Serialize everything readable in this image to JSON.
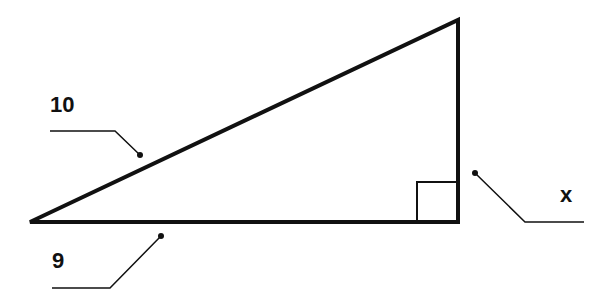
{
  "diagram": {
    "type": "right-triangle",
    "labels": {
      "hypotenuse": "10",
      "base": "9",
      "height": "x"
    },
    "colors": {
      "stroke": "#111111",
      "background": "#ffffff"
    }
  }
}
